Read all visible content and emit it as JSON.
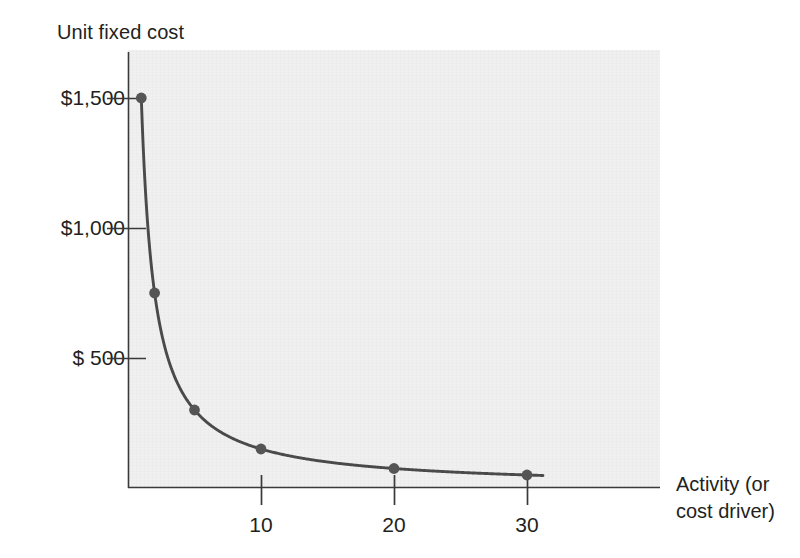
{
  "chart_data": {
    "type": "line",
    "title": "",
    "ylabel": "Unit fixed cost",
    "xlabel_lines": [
      "Activity (or",
      "cost driver)"
    ],
    "xlabel": "Activity (or cost driver)",
    "x": [
      1,
      2,
      5,
      10,
      20,
      30
    ],
    "values": [
      1500,
      750,
      300,
      150,
      75,
      50
    ],
    "series": [
      {
        "name": "Unit fixed cost",
        "values": [
          1500,
          750,
          300,
          150,
          75,
          50
        ]
      }
    ],
    "point_labels": [
      "1500",
      "750",
      "300",
      "150",
      "75",
      "50"
    ],
    "xlim": [
      0,
      40
    ],
    "ylim": [
      0,
      1700
    ],
    "x_ticks": [
      10,
      20,
      30
    ],
    "x_tick_labels": [
      "10",
      "20",
      "30"
    ],
    "y_ticks": [
      500,
      1000,
      1500
    ],
    "y_tick_labels": [
      "$  500",
      "$1,000",
      "$1,500"
    ],
    "grid": false,
    "legend": "none",
    "markers": true,
    "curve_color": "#4a4a4a",
    "marker_color": "#555555",
    "axis_color": "#333333",
    "plot_background": "#f0f0f0",
    "page_background": "#ffffff",
    "annotations": []
  },
  "axes": {
    "y_title": "Unit fixed cost",
    "x_title_line1": "Activity (or",
    "x_title_line2": "cost driver)"
  },
  "y_ticks": [
    {
      "label": "$1,500",
      "value": 1500
    },
    {
      "label": "$1,000",
      "value": 1000
    },
    {
      "label": "$  500",
      "value": 500
    }
  ],
  "x_ticks": [
    {
      "label": "10",
      "value": 10
    },
    {
      "label": "20",
      "value": 20
    },
    {
      "label": "30",
      "value": 30
    }
  ]
}
